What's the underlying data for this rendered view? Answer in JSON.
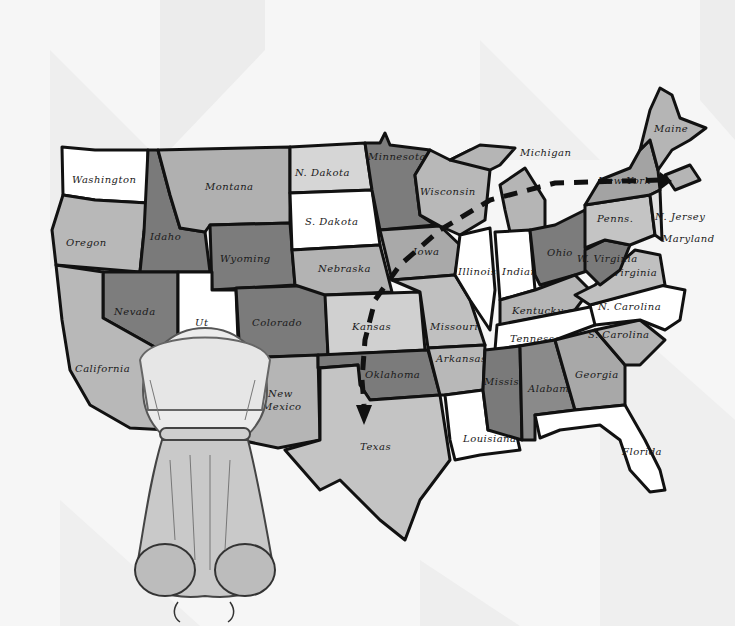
{
  "illustration": {
    "subject": "Hand-drawn map of the United States with a dog viewed from behind",
    "route": {
      "description": "Dashed line from New York westward across Michigan and Wisconsin to Iowa, then south through Kansas and Oklahoma to an arrowhead in Texas",
      "start": "New York",
      "end": "Texas"
    },
    "colors": {
      "background": "#f6f6f6",
      "background_panel": "#ebebeb",
      "white_state": "#ffffff",
      "light_state": "#c8c8c8",
      "mid_state": "#a9a9a9",
      "dark_state": "#7a7a7a",
      "outline": "#111111"
    }
  },
  "states": {
    "washington": "Washington",
    "oregon": "Oregon",
    "california": "California",
    "idaho": "Idaho",
    "nevada": "Nevada",
    "montana": "Montana",
    "wyoming": "Wyoming",
    "utah": "Ut",
    "colorado": "Colorado",
    "new_mexico_1": "New",
    "new_mexico_2": "Mexico",
    "n_dakota": "N. Dakota",
    "s_dakota": "S. Dakota",
    "nebraska": "Nebraska",
    "kansas": "Kansas",
    "oklahoma": "Oklahoma",
    "texas": "Texas",
    "minnesota": "Minnesota",
    "iowa": "Iowa",
    "missouri": "Missouri",
    "arkansas": "Arkansas",
    "louisiana": "Louisiana",
    "wisconsin": "Wisconsin",
    "illinois": "Illinois",
    "michigan": "Michigan",
    "indiana": "Indiana",
    "ohio": "Ohio",
    "kentucky": "Kentucky",
    "tennessee": "Tennessee",
    "mississippi": "Mississippi",
    "alabama": "Alabama",
    "georgia": "Georgia",
    "florida": "Florida",
    "s_carolina": "S. Carolina",
    "n_carolina": "N. Carolina",
    "virginia": "Virginia",
    "w_virginia": "W. Virginia",
    "penns": "Penns.",
    "new_york": "New York",
    "n_jersey": "N. Jersey",
    "maryland": "Maryland",
    "maine": "Maine"
  }
}
